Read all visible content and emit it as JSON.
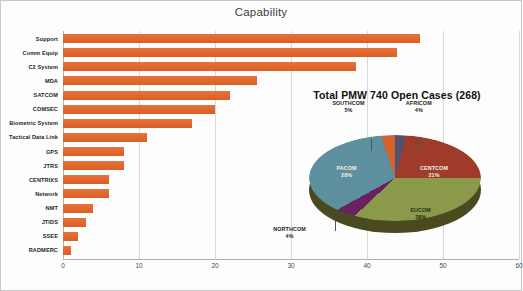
{
  "slide": {
    "background_color": "#fdfdfd",
    "border_color": "#c9c9c9"
  },
  "bar_chart_title": "Capability",
  "pie_chart_title": "Total PMW 740 Open Cases (268)",
  "chart_data": [
    {
      "type": "bar",
      "orientation": "horizontal",
      "title": "Capability",
      "xlabel": "",
      "ylabel": "",
      "xlim": [
        0,
        60
      ],
      "grid": true,
      "bar_color": "#e0692f",
      "categories": [
        "Support",
        "Comm Equip",
        "C2 System",
        "MDA",
        "SATCOM",
        "COMSEC",
        "Biometric System",
        "Tactical Data Link",
        "GPS",
        "JTRS",
        "CENTRIXS",
        "Network",
        "NMT",
        "JTIDS",
        "SSEE",
        "RADMERC"
      ],
      "values": [
        47,
        44,
        38.5,
        25.5,
        22,
        20,
        17,
        11,
        8,
        8,
        6,
        6,
        4,
        3,
        2,
        1
      ],
      "xticks": [
        0,
        10,
        20,
        30,
        40,
        50,
        60
      ],
      "xticklabels": [
        "0",
        "10",
        "20",
        "30",
        "40",
        "50",
        "60"
      ]
    },
    {
      "type": "pie",
      "title": "Total PMW 740 Open Cases (268)",
      "total": 268,
      "three_d": true,
      "legend": "none",
      "labels_position": "mixed",
      "slices": [
        {
          "name": "AFRICOM",
          "percent": 4,
          "label": "AFRICOM",
          "value_label": "4%",
          "color": "#4f5372",
          "label_placement": "outside"
        },
        {
          "name": "CENTCOM",
          "percent": 21,
          "label": "CENTCOM",
          "value_label": "21%",
          "color": "#9e3b2a",
          "label_placement": "inside"
        },
        {
          "name": "EUCOM",
          "percent": 38,
          "label": "EUCOM",
          "value_label": "38%",
          "color": "#8a9a4a",
          "label_placement": "inside"
        },
        {
          "name": "NORTHCOM",
          "percent": 4,
          "label": "NORTHCOM",
          "value_label": "4%",
          "color": "#6b2060",
          "label_placement": "outside"
        },
        {
          "name": "PACOM",
          "percent": 28,
          "label": "PACOM",
          "value_label": "28%",
          "color": "#5d8f9e",
          "label_placement": "inside"
        },
        {
          "name": "SOUTHCOM",
          "percent": 5,
          "label": "SOUTHCOM",
          "value_label": "5%",
          "color": "#d4622c",
          "label_placement": "outside"
        }
      ]
    }
  ]
}
